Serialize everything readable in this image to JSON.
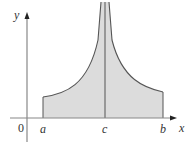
{
  "figure": {
    "type": "improper integral region with vertical asymptote",
    "axes": {
      "x_label": "x",
      "y_label": "y",
      "origin_label": "0"
    },
    "points": [
      {
        "label": "a",
        "role": "left endpoint"
      },
      {
        "label": "c",
        "role": "vertical asymptote"
      },
      {
        "label": "b",
        "role": "right endpoint"
      }
    ],
    "region": {
      "fill": "#dcdcdc",
      "stroke": "#555555"
    }
  }
}
